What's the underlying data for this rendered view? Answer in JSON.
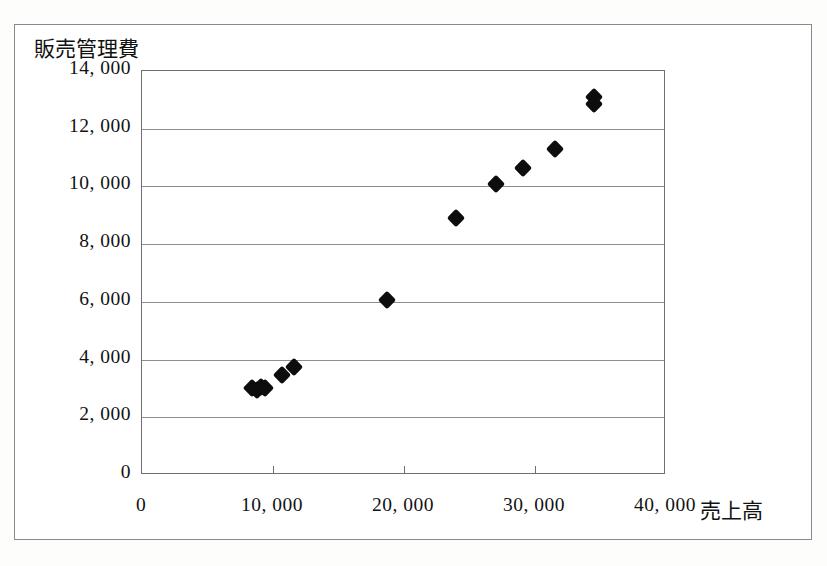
{
  "chart_data": {
    "type": "scatter",
    "title": "",
    "xlabel": "売上高",
    "ylabel": "販売管理費",
    "xlim": [
      0,
      40000
    ],
    "ylim": [
      0,
      14000
    ],
    "grid": "horizontal",
    "legend": "none",
    "marker": "filled-diamond",
    "marker_color": "#0d0d0d",
    "xticks": [
      0,
      10000,
      20000,
      30000,
      40000
    ],
    "xtick_labels": [
      "0",
      "10, 000",
      "20, 000",
      "30, 000",
      "40, 000"
    ],
    "yticks": [
      0,
      2000,
      4000,
      6000,
      8000,
      10000,
      12000,
      14000
    ],
    "ytick_labels": [
      "0",
      "2, 000",
      "4, 000",
      "6, 000",
      "8, 000",
      "10, 000",
      "12, 000",
      "14, 000"
    ],
    "series": [
      {
        "name": "売上高 vs 販売管理費",
        "points": [
          {
            "x": 8400,
            "y": 3000
          },
          {
            "x": 8800,
            "y": 2950
          },
          {
            "x": 9100,
            "y": 3050
          },
          {
            "x": 9400,
            "y": 3000
          },
          {
            "x": 10700,
            "y": 3450
          },
          {
            "x": 11600,
            "y": 3750
          },
          {
            "x": 18700,
            "y": 6050
          },
          {
            "x": 24000,
            "y": 8900
          },
          {
            "x": 27000,
            "y": 10100
          },
          {
            "x": 29100,
            "y": 10650
          },
          {
            "x": 31500,
            "y": 11300
          },
          {
            "x": 34500,
            "y": 13100
          },
          {
            "x": 34500,
            "y": 12850
          }
        ]
      }
    ]
  },
  "axes": {
    "y_title": "販売管理費",
    "x_title": "売上高"
  }
}
